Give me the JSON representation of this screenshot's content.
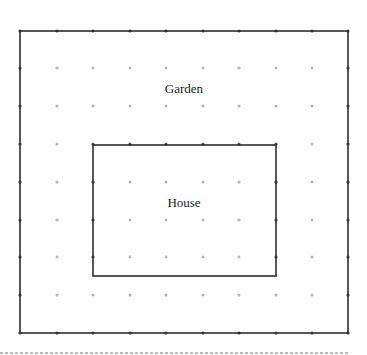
{
  "diagram": {
    "type": "dot-grid area diagram",
    "outer_region": {
      "label": "Garden",
      "x": 20,
      "y": 31,
      "width": 328,
      "height": 302
    },
    "inner_region": {
      "label": "House",
      "x": 93,
      "y": 145,
      "width": 183,
      "height": 131
    },
    "grid": {
      "xs": [
        20,
        57,
        93,
        130,
        166,
        203,
        239,
        276,
        312,
        348
      ],
      "ys": [
        31,
        68,
        106,
        144,
        182,
        220,
        257,
        295,
        333
      ],
      "dot_color": "#b5b5b5",
      "dot_on_line_color": "#555555"
    },
    "colors": {
      "line": "#222222",
      "dashed_rule": "#bbbbbb",
      "background": "#ffffff"
    }
  }
}
